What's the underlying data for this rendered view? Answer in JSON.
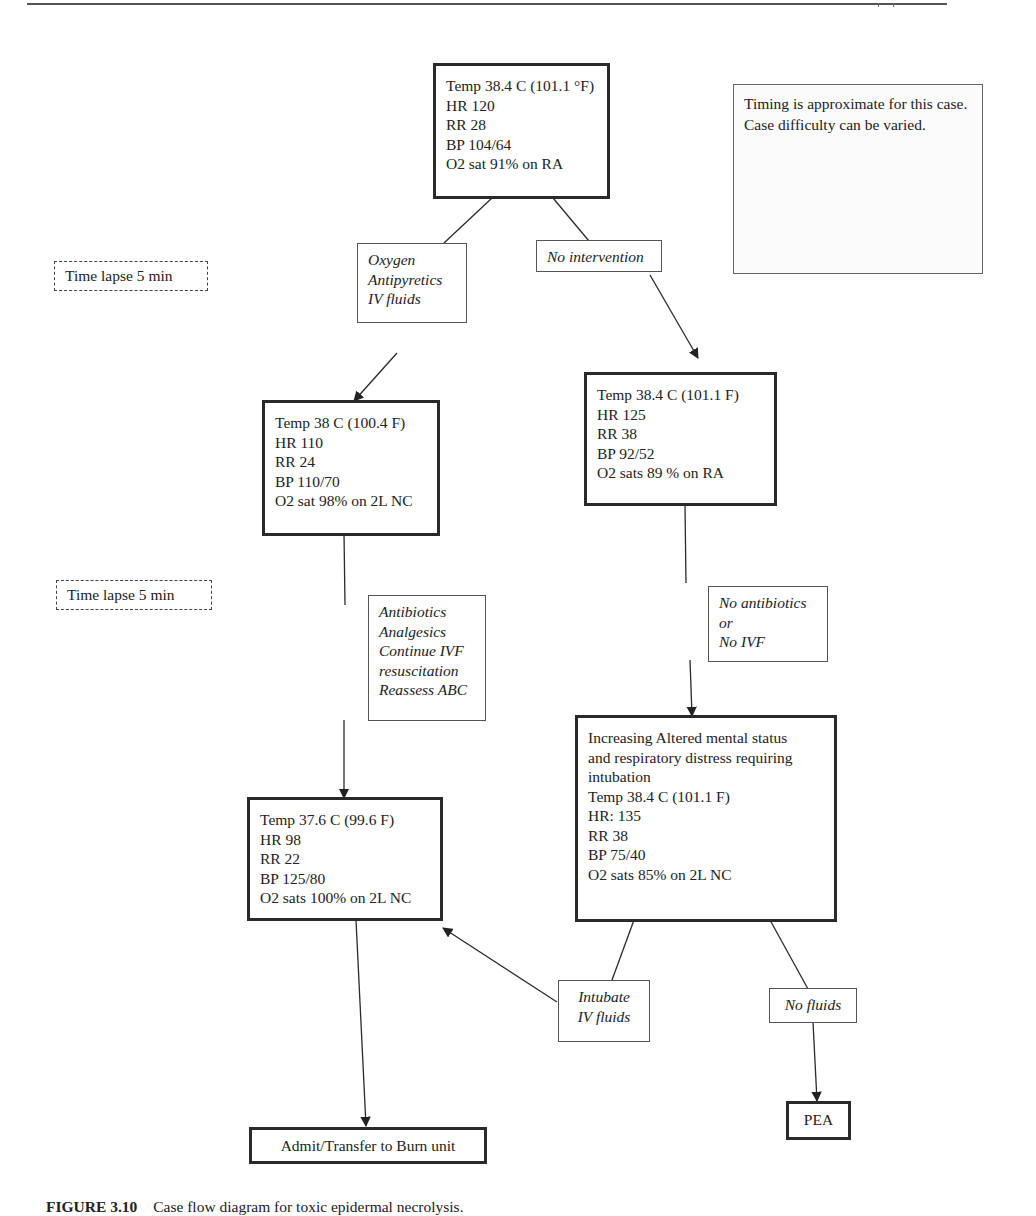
{
  "page": {
    "header_rule": true
  },
  "note": {
    "text": "Timing is approximate for this case. Case difficulty can be varied."
  },
  "time_lapses": [
    {
      "label": "Time lapse 5 min"
    },
    {
      "label": "Time lapse 5 min"
    }
  ],
  "nodes": {
    "initial": {
      "lines": [
        "Temp 38.4 C (101.1 °F)",
        "HR 120",
        "RR 28",
        "BP 104/64",
        "O2 sat 91% on RA"
      ]
    },
    "action_treat": {
      "lines": [
        "Oxygen",
        "Antipyretics",
        "IV fluids"
      ]
    },
    "action_none": {
      "lines": [
        "No intervention"
      ]
    },
    "improved_1": {
      "lines": [
        "Temp 38 C (100.4 F)",
        "HR 110",
        "RR 24",
        "BP 110/70",
        "O2 sat 98% on 2L NC"
      ]
    },
    "worse_1": {
      "lines": [
        "Temp 38.4 C (101.1 F)",
        "HR 125",
        "RR 38",
        "BP 92/52",
        "O2 sats 89 % on RA"
      ]
    },
    "action_antibiotics": {
      "lines": [
        "Antibiotics",
        "Analgesics",
        "Continue IVF",
        "resuscitation",
        "Reassess ABC"
      ]
    },
    "action_no_antibiotics": {
      "lines": [
        "No antibiotics",
        "or",
        "No IVF"
      ]
    },
    "improved_2": {
      "lines": [
        "Temp 37.6 C (99.6 F)",
        "HR 98",
        "RR 22",
        "BP 125/80",
        "O2 sats 100% on 2L NC"
      ]
    },
    "worse_2": {
      "lines": [
        "Increasing Altered mental status",
        "and respiratory distress requiring",
        "intubation",
        "Temp 38.4 C (101.1 F)",
        "HR: 135",
        "RR 38",
        "BP 75/40",
        "O2 sats 85% on 2L NC"
      ]
    },
    "action_intubate": {
      "lines": [
        "Intubate",
        "IV fluids"
      ]
    },
    "action_no_fluids": {
      "lines": [
        "No fluids"
      ]
    },
    "outcome_admit": {
      "lines": [
        "Admit/Transfer to Burn unit"
      ]
    },
    "outcome_pea": {
      "lines": [
        "PEA"
      ]
    }
  },
  "caption": {
    "figure_label": "FIGURE 3.10",
    "text": "Case flow diagram for toxic epidermal necrolysis."
  },
  "colors": {
    "stroke": "#2a2a2a",
    "text": "#222222",
    "background": "#ffffff"
  }
}
